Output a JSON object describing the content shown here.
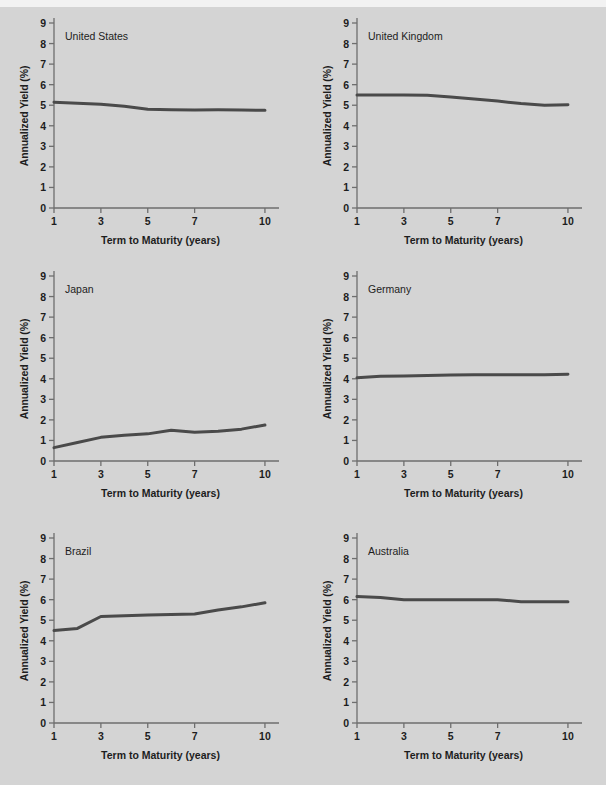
{
  "top_clip_ghost": "· · · ·",
  "background_color": "#d4d4d4",
  "axis_color": "#6e6e6e",
  "line_color": "#4a4a4a",
  "text_color": "#1d1d1d",
  "axes": {
    "ylabel": "Annualized Yield (%)",
    "xlabel": "Term  to Maturity (years)",
    "yticks": [
      "0",
      "1",
      "2",
      "3",
      "4",
      "5",
      "6",
      "7",
      "8",
      "9"
    ],
    "xticks": [
      "1",
      "3",
      "5",
      "7",
      "10"
    ],
    "ylim": [
      0,
      9
    ],
    "xlim": [
      1,
      10.6
    ]
  },
  "chart_data": {
    "type": "line",
    "title": "",
    "xlabel": "Term  to Maturity (years)",
    "ylabel": "Annualized Yield (%)",
    "xlim": [
      1,
      10.6
    ],
    "ylim": [
      0,
      9
    ],
    "xtick_values": [
      1,
      3,
      5,
      7,
      10
    ],
    "ytick_values": [
      0,
      1,
      2,
      3,
      4,
      5,
      6,
      7,
      8,
      9
    ],
    "grid": false,
    "legend": "none (panel labels inside each subplot)",
    "layout": "2 columns x 3 rows of small-multiple panels",
    "panels": [
      {
        "label": "United States",
        "x": [
          1,
          2,
          3,
          4,
          5,
          6,
          7,
          8,
          9,
          10
        ],
        "values": [
          5.15,
          5.1,
          5.05,
          4.95,
          4.8,
          4.78,
          4.77,
          4.78,
          4.77,
          4.75
        ]
      },
      {
        "label": "United Kingdom",
        "x": [
          1,
          2,
          3,
          4,
          5,
          6,
          7,
          8,
          9,
          10
        ],
        "values": [
          5.5,
          5.5,
          5.5,
          5.48,
          5.4,
          5.3,
          5.2,
          5.08,
          5.0,
          5.02
        ]
      },
      {
        "label": "Japan",
        "x": [
          1,
          2,
          3,
          4,
          5,
          6,
          7,
          8,
          9,
          10
        ],
        "values": [
          0.65,
          0.9,
          1.15,
          1.25,
          1.32,
          1.5,
          1.4,
          1.45,
          1.55,
          1.75
        ]
      },
      {
        "label": "Germany",
        "x": [
          1,
          2,
          3,
          4,
          5,
          6,
          7,
          8,
          9,
          10
        ],
        "values": [
          4.05,
          4.12,
          4.14,
          4.16,
          4.18,
          4.2,
          4.2,
          4.2,
          4.2,
          4.22
        ]
      },
      {
        "label": "Brazil",
        "x": [
          1,
          2,
          3,
          4,
          5,
          6,
          7,
          8,
          9,
          10
        ],
        "values": [
          4.5,
          4.6,
          5.18,
          5.22,
          5.25,
          5.28,
          5.3,
          5.5,
          5.65,
          5.85
        ]
      },
      {
        "label": "Australia",
        "x": [
          1,
          2,
          3,
          4,
          5,
          6,
          7,
          8,
          9,
          10
        ],
        "values": [
          6.15,
          6.1,
          6.0,
          6.0,
          6.0,
          6.0,
          6.0,
          5.9,
          5.9,
          5.9
        ]
      }
    ]
  }
}
